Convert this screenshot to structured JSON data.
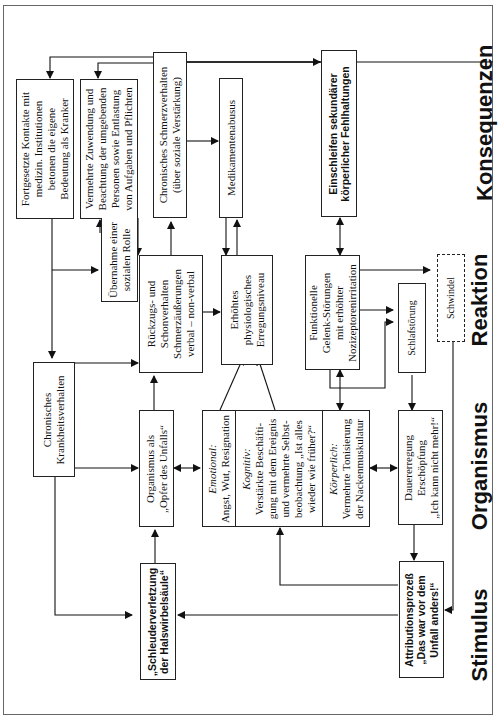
{
  "stages": {
    "konsequenzen": "Konsequenzen",
    "reaktion": "Reaktion",
    "organismus": "Organismus",
    "stimulus": "Stimulus"
  },
  "boxes": {
    "fortgesetzte": [
      "Fortgesetzte Kontakte mit",
      "medizin. Institutionen",
      "betonen die eigene",
      "Bedeutung als Kranker"
    ],
    "vermehrte_zuwendung": [
      "Vermehrte Zuwendung und",
      "Beachtung der umgebenden",
      "Personen sowie Entlastung",
      "von Aufgaben und Pflichten"
    ],
    "chronisches_schmerz": [
      "Chronisches Schmerzverhalten",
      "(über soziale Verstärkung)"
    ],
    "medikamentenabusus": [
      "Medikamentenabusus"
    ],
    "einschleifen": [
      "Einschleifen sekundärer",
      "körperlicher Fehlhaltungen"
    ],
    "uebernahme": [
      "Übernahme einer",
      "sozialen Rolle"
    ],
    "rueckzug": [
      "Rückzugs- und",
      "Schonverhalten",
      "Schmerzäußerungen",
      "verbal – non-verbal"
    ],
    "erhoehtes": [
      "Erhöhtes",
      "physiologisches",
      "Erregungsniveau"
    ],
    "funktionelle": [
      "Funktionelle",
      "Gelenk-Störungen",
      "mit erhöhter",
      "Nozizeptorenirritation"
    ],
    "schlafstoerung": [
      "Schlafstörung"
    ],
    "schwindel": [
      "Schwindel"
    ],
    "chronisches_krankheit": [
      "Chronisches",
      "Krankheitsverhalten"
    ],
    "organismus_opfer": [
      "Organismus als",
      "„Opfer des Unfalls“"
    ],
    "emotional": {
      "heading": "Emotional:",
      "lines": [
        "Angst, Wut, Resignation"
      ]
    },
    "kognitiv": {
      "heading": "Kognitiv:",
      "lines": [
        "Verstärkte Beschäfti-",
        "gung mit dem Ereignis",
        "und vermehrte Selbst-",
        "beobachtung „Ist alles",
        "wieder wie früher?“"
      ]
    },
    "koerperlich": {
      "heading": "Körperlich:",
      "lines": [
        "Vermehrte Tonisierung",
        "der Nackenmuskulatur"
      ]
    },
    "dauererregung": [
      "Dauererregung",
      "Erschöpfung",
      "„Ich kann nicht mehr!“"
    ],
    "schleuder": [
      "„Schleuderverletzung",
      "der Halswirbelsäule“"
    ],
    "attribution": [
      "Attributionsprozeß",
      "„Das war vor dem",
      "Unfall anders!“"
    ]
  }
}
